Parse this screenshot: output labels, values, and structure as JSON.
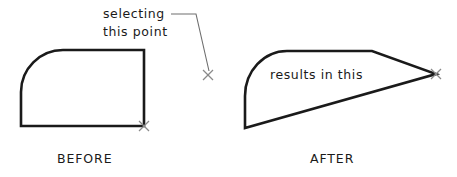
{
  "figure": {
    "kind": "cad-stretch-illustration",
    "background_color": "#ffffff",
    "outline_color": "#1a1a1a",
    "leader_color": "#6e6e6e",
    "marker_color": "#8a8a8a",
    "width": 457,
    "height": 177
  },
  "annotations": {
    "selecting_line1": "selecting",
    "selecting_line2": "this  point",
    "results_in_this": "results in this"
  },
  "captions": {
    "before": "BEFORE",
    "after": "AFTER"
  },
  "panels": {
    "before": {
      "label": "BEFORE",
      "shape_name": "rounded-corner-rectangle",
      "description": "Rectangle with rounded upper-left corner",
      "vertices": {
        "bottom_left": [
          21,
          126
        ],
        "top_right": [
          144,
          50
        ],
        "bottom_right": [
          144,
          126
        ],
        "arc_start_left": [
          21,
          92
        ],
        "arc_end_top": [
          63,
          50
        ]
      },
      "grip_marker": [
        144,
        126
      ]
    },
    "after": {
      "label": "AFTER",
      "shape_name": "stretched-rounded-shape",
      "description": "Same shape with lower-right grip stretched out to the right",
      "vertices": {
        "bottom_left": [
          245,
          128
        ],
        "top_bend": [
          372,
          51
        ],
        "apex_right": [
          436,
          74
        ],
        "arc_start_left": [
          245,
          96
        ],
        "arc_end_top": [
          287,
          51
        ]
      },
      "grip_marker": [
        436,
        74
      ]
    }
  },
  "leader": {
    "name": "selecting-this-point-leader",
    "start": [
      171,
      14
    ],
    "elbow": [
      196,
      14
    ],
    "end": [
      209,
      71
    ],
    "target_marker": [
      208,
      75
    ]
  },
  "markers": [
    {
      "name": "grip-marker-before",
      "x": 144,
      "y": 126,
      "size": 9
    },
    {
      "name": "grip-marker-selection",
      "x": 208,
      "y": 75,
      "size": 9
    },
    {
      "name": "grip-marker-after",
      "x": 436,
      "y": 74,
      "size": 9
    }
  ]
}
